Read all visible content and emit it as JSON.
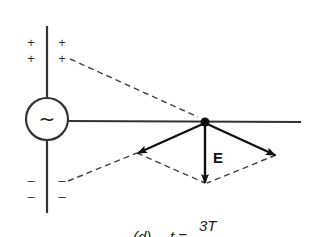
{
  "diagram": {
    "source_symbol": "~",
    "plus_signs": [
      "+",
      "+",
      "+",
      "+"
    ],
    "minus_signs": [
      "–",
      "–",
      "–",
      "–"
    ],
    "field_label": "E",
    "caption": {
      "part": "(d)",
      "equation_lhs": "t =",
      "numerator": "3T"
    },
    "colors": {
      "line": "#333333",
      "arrow": "#111111",
      "dash": "#444444",
      "background": "#ffffff"
    }
  }
}
